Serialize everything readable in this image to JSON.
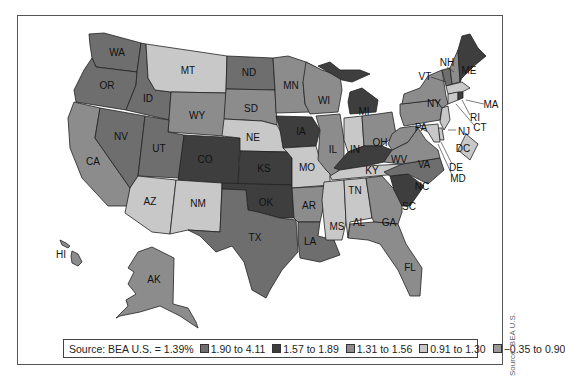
{
  "legend": {
    "source": "Source: BEA U.S.  = 1.39%",
    "items": [
      {
        "label": "1.90 to 4.11",
        "color": "#6e6e6e"
      },
      {
        "label": "1.57 to 1.89",
        "color": "#3e3e3e"
      },
      {
        "label": "1.31 to 1.56",
        "color": "#8c8c8c"
      },
      {
        "label": "0.91 to 1.30",
        "color": "#c8c8c8"
      },
      {
        "label": "−0.35 to 0.90",
        "color": "#9a9a9a"
      }
    ]
  },
  "side_credit": "Source: BEA U.S.",
  "states": {
    "WA": "WA",
    "OR": "OR",
    "CA": "CA",
    "ID": "ID",
    "NV": "NV",
    "MT": "MT",
    "WY": "WY",
    "UT": "UT",
    "AZ": "AZ",
    "CO": "CO",
    "NM": "NM",
    "ND": "ND",
    "SD": "SD",
    "NE": "NE",
    "KS": "KS",
    "OK": "OK",
    "TX": "TX",
    "MN": "MN",
    "IA": "IA",
    "MO": "MO",
    "AR": "AR",
    "LA": "LA",
    "WI": "WI",
    "IL": "IL",
    "MI": "MI",
    "IN": "IN",
    "OH": "OH",
    "KY": "KY",
    "TN": "TN",
    "MS": "MS",
    "AL": "AL",
    "GA": "GA",
    "FL": "FL",
    "SC": "SC",
    "NC": "NC",
    "VA": "VA",
    "WV": "WV",
    "PA": "PA",
    "NY": "NY",
    "VT": "VT",
    "NH": "NH",
    "ME": "ME",
    "MA": "MA",
    "RI": "RI",
    "CT": "CT",
    "NJ": "NJ",
    "DE": "DE",
    "MD": "MD",
    "DC": "DC",
    "AK": "AK",
    "HI": "HI"
  },
  "state_class": {
    "WA": "1.90 to 4.11",
    "OR": "1.90 to 4.11",
    "ID": "1.90 to 4.11",
    "NV": "1.90 to 4.11",
    "UT": "1.90 to 4.11",
    "CO": "1.57 to 1.89",
    "KS": "1.57 to 1.89",
    "OK": "1.57 to 1.89",
    "IA": "1.57 to 1.89",
    "MI": "1.57 to 1.89",
    "KY": "1.57 to 1.89",
    "SC": "1.57 to 1.89",
    "ME": "1.57 to 1.89",
    "ND": "1.90 to 4.11",
    "TX": "1.90 to 4.11",
    "LA": "1.90 to 4.11",
    "NC": "1.90 to 4.11",
    "VT": "1.90 to 4.11",
    "CA": "1.31 to 1.56",
    "WY": "1.31 to 1.56",
    "SD": "1.31 to 1.56",
    "MN": "1.31 to 1.56",
    "WI": "1.31 to 1.56",
    "IL": "1.31 to 1.56",
    "AR": "1.31 to 1.56",
    "GA": "1.31 to 1.56",
    "FL": "1.31 to 1.56",
    "NY": "1.31 to 1.56",
    "PA": "1.31 to 1.56",
    "OH": "1.31 to 1.56",
    "WV": "1.31 to 1.56",
    "VA": "1.31 to 1.56",
    "AK": "1.31 to 1.56",
    "HI": "1.31 to 1.56",
    "MT": "0.91 to 1.30",
    "NE": "0.91 to 1.30",
    "MO": "0.91 to 1.30",
    "IN": "0.91 to 1.30",
    "TN": "0.91 to 1.30",
    "AZ": "0.91 to 1.30",
    "NM": "0.91 to 1.30",
    "MS": "0.91 to 1.30",
    "AL": "0.91 to 1.30",
    "MA": "0.91 to 1.30",
    "NJ": "0.91 to 1.30",
    "DC": "0.91 to 1.30",
    "CT": "0.91 to 1.30",
    "DE": "0.91 to 1.30",
    "MD": "0.91 to 1.30",
    "NH": "1.31 to 1.56",
    "RI": "1.57 to 1.89"
  }
}
